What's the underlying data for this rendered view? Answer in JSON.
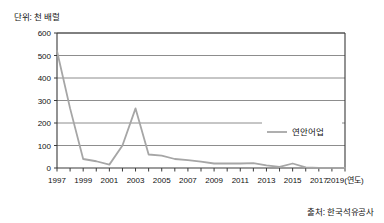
{
  "figure": {
    "unit_label": "단위: 천 배럴",
    "source_label": "출처: 한국석유공사"
  },
  "chart_data": {
    "type": "line",
    "title": "",
    "subtitle": "",
    "xlabel": "(연도)",
    "ylabel": "단위: 천 배럴",
    "ylim": [
      0,
      600
    ],
    "yticks": [
      0,
      100,
      200,
      300,
      400,
      500,
      600
    ],
    "ytick_labels": [
      "0",
      "100",
      "200",
      "300",
      "400",
      "500",
      "600"
    ],
    "xlim": [
      1997,
      2019
    ],
    "xticks": [
      1997,
      1998,
      1999,
      2000,
      2001,
      2002,
      2003,
      2004,
      2005,
      2006,
      2007,
      2008,
      2009,
      2010,
      2011,
      2012,
      2013,
      2014,
      2015,
      2016,
      2017,
      2018,
      2019
    ],
    "xtick_labels": [
      "1997",
      "1999",
      "2001",
      "2003",
      "2005",
      "2007",
      "2009",
      "2011",
      "2013",
      "2015",
      "2017",
      "2019(연도)"
    ],
    "xtick_label_years": [
      1997,
      1999,
      2001,
      2003,
      2005,
      2007,
      2009,
      2011,
      2013,
      2015,
      2017,
      2019
    ],
    "grid": "horizontal",
    "legend_position": "inside-right",
    "series": [
      {
        "name": "연안어업",
        "color": "#a6a6a6",
        "x": [
          1997,
          1998,
          1999,
          2000,
          2001,
          2002,
          2003,
          2004,
          2005,
          2006,
          2007,
          2008,
          2009,
          2010,
          2011,
          2012,
          2013,
          2014,
          2015,
          2016,
          2017,
          2018,
          2019
        ],
        "values": [
          520,
          265,
          40,
          30,
          15,
          100,
          265,
          60,
          55,
          40,
          35,
          28,
          20,
          20,
          20,
          22,
          12,
          5,
          20,
          3,
          1,
          1,
          1
        ]
      }
    ],
    "legend": [
      "연안어업"
    ]
  },
  "axes": {
    "plot_left": 57,
    "plot_right": 345,
    "plot_top": 33,
    "plot_bottom": 168
  }
}
